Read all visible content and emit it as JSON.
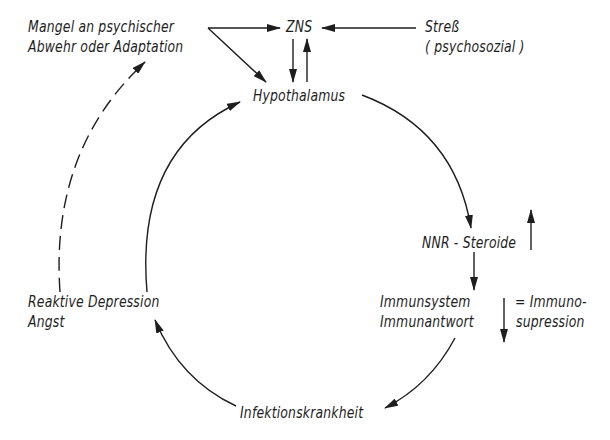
{
  "diagram": {
    "type": "cycle-flowchart",
    "nodes": {
      "mangel": {
        "line1": "Mangel an psychischer",
        "line2": "Abwehr oder Adaptation"
      },
      "zns": {
        "label": "ZNS"
      },
      "stress": {
        "line1": "Streß",
        "line2": "( psychosozial )"
      },
      "hypothalamus": {
        "label": "Hypothalamus"
      },
      "nnr": {
        "label": "NNR - Steroide",
        "indicator": "up-arrow"
      },
      "immun": {
        "line1": "Immunsystem",
        "line2": "Immunantwort",
        "indicator": "down-arrow"
      },
      "immunosuppression": {
        "line1": "= Immuno-",
        "line2": "supression"
      },
      "infektion": {
        "label": "Infektionskrankheit"
      },
      "depression": {
        "line1": "Reaktive Depression",
        "line2": "Angst"
      }
    },
    "edges": [
      {
        "from": "Mangel an psychischer Abwehr oder Adaptation",
        "to": "ZNS",
        "style": "solid"
      },
      {
        "from": "Mangel an psychischer Abwehr oder Adaptation",
        "to": "Hypothalamus",
        "style": "solid"
      },
      {
        "from": "Streß (psychosozial)",
        "to": "ZNS",
        "style": "solid"
      },
      {
        "from": "ZNS",
        "to": "Hypothalamus",
        "style": "solid"
      },
      {
        "from": "Hypothalamus",
        "to": "ZNS",
        "style": "solid"
      },
      {
        "from": "Hypothalamus",
        "to": "NNR-Steroide",
        "style": "solid-curved"
      },
      {
        "from": "NNR-Steroide",
        "to": "Immunsystem Immunantwort",
        "style": "solid"
      },
      {
        "from": "Immunsystem Immunantwort",
        "to": "Infektionskrankheit",
        "style": "solid-curved"
      },
      {
        "from": "Infektionskrankheit",
        "to": "Reaktive Depression Angst",
        "style": "solid-curved"
      },
      {
        "from": "Reaktive Depression Angst",
        "to": "Hypothalamus",
        "style": "solid-curved"
      },
      {
        "from": "Reaktive Depression Angst",
        "to": "Mangel an psychischer Abwehr oder Adaptation",
        "style": "dashed-curved"
      }
    ],
    "colors": {
      "ink": "#1e1e1e",
      "background": "#ffffff"
    }
  }
}
